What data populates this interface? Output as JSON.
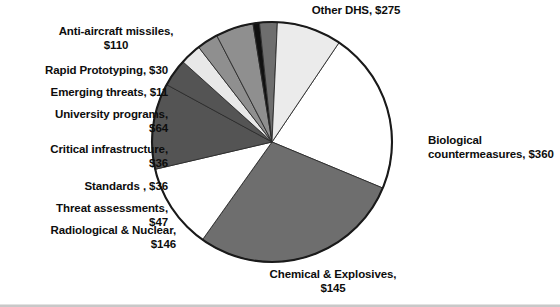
{
  "figure": {
    "units": "dollars in millions",
    "currency_symbol": "$"
  },
  "chart_data": {
    "type": "pie",
    "title": "",
    "subtitle": "",
    "xlabel": "",
    "ylabel": "",
    "legend_position": "none",
    "grid": false,
    "total": 1260,
    "start_angle_deg": -56,
    "direction": "clockwise",
    "categories": [
      "Other DHS",
      "Biological countermeasures",
      "Chemical & Explosives",
      "Radiological & Nuclear",
      "Threat assessments",
      "Standards",
      "Critical infrastructure",
      "University programs",
      "Emerging threats",
      "Rapid Prototyping",
      "Anti-aircraft missiles"
    ],
    "values": [
      275,
      360,
      145,
      146,
      47,
      36,
      36,
      64,
      11,
      30,
      110
    ],
    "colors": [
      "#ffffff",
      "#6e6e6e",
      "#ffffff",
      "#545454",
      "#545454",
      "#e8e8e8",
      "#8f8f8f",
      "#8f8f8f",
      "#111111",
      "#6e6e6e",
      "#ebebeb"
    ],
    "slices": [
      {
        "name": "Other DHS",
        "value": 275,
        "label": "Other DHS,  $275",
        "color": "#ffffff"
      },
      {
        "name": "Biological countermeasures",
        "value": 360,
        "label": "Biological\ncountermeasures,  $360",
        "color": "#6e6e6e"
      },
      {
        "name": "Chemical & Explosives",
        "value": 145,
        "label": "Chemical & Explosives,\n$145",
        "color": "#ffffff"
      },
      {
        "name": "Radiological & Nuclear",
        "value": 146,
        "label": "Radiological & Nuclear,\n$146",
        "color": "#545454"
      },
      {
        "name": "Threat assessments",
        "value": 47,
        "label": "Threat assessments,\n$47",
        "color": "#545454"
      },
      {
        "name": "Standards",
        "value": 36,
        "label": "Standards ,  $36",
        "color": "#e8e8e8"
      },
      {
        "name": "Critical infrastructure",
        "value": 36,
        "label": "Critical infrastructure,\n$36",
        "color": "#8f8f8f"
      },
      {
        "name": "University programs",
        "value": 64,
        "label": "University programs,\n$64",
        "color": "#8f8f8f"
      },
      {
        "name": "Emerging threats",
        "value": 11,
        "label": "Emerging threats,  $11",
        "color": "#111111"
      },
      {
        "name": "Rapid Prototyping",
        "value": 30,
        "label": "Rapid Prototyping,  $30",
        "color": "#6e6e6e"
      },
      {
        "name": "Anti-aircraft missiles",
        "value": 110,
        "label": "Anti-aircraft missiles,\n$110",
        "color": "#ebebeb"
      }
    ]
  },
  "labels": {
    "other_dhs": "Other DHS,  $275",
    "biological": "Biological\ncountermeasures,  $360",
    "chemical": "Chemical & Explosives,\n$145",
    "radiological": "Radiological & Nuclear,\n$146",
    "threat_assessments": "Threat assessments,\n$47",
    "standards": "Standards ,  $36",
    "critical_infrastructure": "Critical infrastructure,\n$36",
    "university_programs": "University programs,\n$64",
    "emerging_threats": "Emerging threats,  $11",
    "rapid_prototyping": "Rapid Prototyping,  $30",
    "anti_aircraft": "Anti-aircraft missiles,\n$110"
  }
}
